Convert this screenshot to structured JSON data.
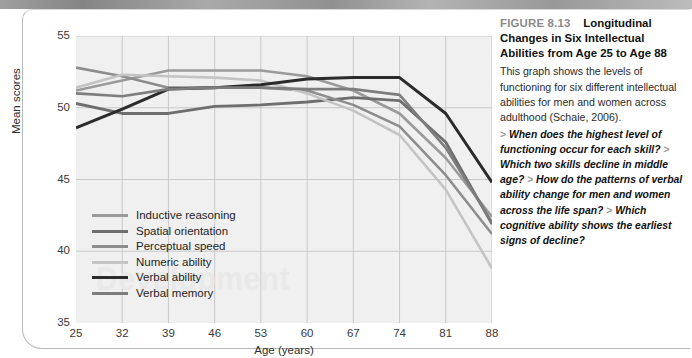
{
  "figure": {
    "number": "FIGURE 8.13",
    "title": "Longitudinal Changes in Six Intellectual Abilities from Age 25 to Age 88",
    "body": "This graph shows the levels of functioning for six different intellectual abilities for men and women across adulthood (Schaie, 2006).",
    "questions": [
      "When does the highest level of functioning occur for each skill?",
      "Which two skills decline in middle age?",
      "How do the patterns of verbal ability change for men and women across the life span?",
      "Which cognitive ability shows the earliest signs of decline?"
    ],
    "question_marker": ">"
  },
  "watermark_text": "Development",
  "chart_data": {
    "type": "line",
    "title": "",
    "xlabel": "Age (years)",
    "ylabel": "Mean scores",
    "x": [
      25,
      32,
      39,
      46,
      53,
      60,
      67,
      74,
      81,
      88
    ],
    "categories": [
      "25",
      "32",
      "39",
      "46",
      "53",
      "60",
      "67",
      "74",
      "81",
      "88"
    ],
    "xtick_labels": [
      "25",
      "32",
      "39",
      "46",
      "53",
      "60",
      "67",
      "74",
      "81",
      "88"
    ],
    "ytick_labels": [
      "35",
      "40",
      "45",
      "50",
      "55"
    ],
    "yticks": [
      35,
      40,
      45,
      50,
      55
    ],
    "ylim": [
      35,
      55
    ],
    "xlim": [
      25,
      88
    ],
    "grid": true,
    "legend_position": "inside-lower-left",
    "plot_background": "#f0f0f0",
    "series": [
      {
        "name": "Inductive reasoning",
        "color": "#9a9a9a",
        "width": 2.6,
        "values": [
          51.2,
          51.9,
          52.6,
          52.6,
          52.6,
          52.2,
          51.2,
          49.6,
          46.5,
          42.4
        ]
      },
      {
        "name": "Spatial orientation",
        "color": "#6e6e6e",
        "width": 2.8,
        "values": [
          50.3,
          49.6,
          49.6,
          50.1,
          50.2,
          50.4,
          50.7,
          50.5,
          47.6,
          41.9
        ]
      },
      {
        "name": "Perceptual speed",
        "color": "#8d8d8d",
        "width": 2.6,
        "values": [
          52.8,
          52.2,
          51.4,
          51.4,
          51.4,
          51.2,
          50.2,
          48.7,
          45.3,
          41.2
        ]
      },
      {
        "name": "Numeric ability",
        "color": "#c4c4c4",
        "width": 2.6,
        "values": [
          51.4,
          52.3,
          52.2,
          52.1,
          51.9,
          51.0,
          49.8,
          48.1,
          44.3,
          38.8
        ]
      },
      {
        "name": "Verbal ability",
        "color": "#2b2b2b",
        "width": 3.0,
        "values": [
          48.6,
          49.9,
          51.3,
          51.4,
          51.6,
          52.0,
          52.1,
          52.1,
          49.6,
          44.8
        ]
      },
      {
        "name": "Verbal memory",
        "color": "#7d7d7d",
        "width": 2.6,
        "values": [
          51.0,
          50.8,
          51.3,
          51.4,
          51.4,
          51.3,
          51.3,
          50.9,
          47.2,
          42.0
        ]
      }
    ]
  }
}
